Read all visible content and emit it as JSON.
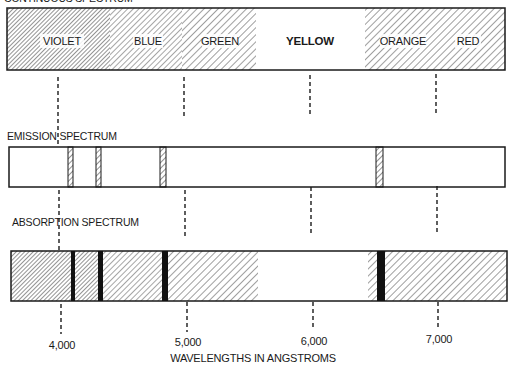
{
  "title": "CONTINUOUS SPECTRUM",
  "continuous_spectrum": {
    "bands": [
      {
        "label": "VIOLET",
        "x_from": 7,
        "x_to": 110,
        "hatch": "dense"
      },
      {
        "label": "BLUE",
        "x_from": 110,
        "x_to": 182,
        "hatch": "medium"
      },
      {
        "label": "GREEN",
        "x_from": 182,
        "x_to": 256,
        "hatch": "sparse"
      },
      {
        "label": "YELLOW",
        "x_from": 256,
        "x_to": 365,
        "hatch": "none"
      },
      {
        "label": "ORANGE",
        "x_from": 365,
        "x_to": 432,
        "hatch": "sparse"
      },
      {
        "label": "RED",
        "x_from": 432,
        "x_to": 505,
        "hatch": "sparse"
      }
    ]
  },
  "emission": {
    "label": "EMISSION SPECTRUM",
    "lines_angstrom": [
      4100,
      4340,
      4860,
      6560
    ]
  },
  "absorption": {
    "label": "ABSORPTION SPECTRUM",
    "lines_angstrom": [
      4100,
      4340,
      4860,
      6560
    ]
  },
  "axis": {
    "label": "WAVELENGTHS IN ANGSTROMS",
    "ticks": [
      {
        "value": 4000,
        "label": "4,000"
      },
      {
        "value": 5000,
        "label": "5,000"
      },
      {
        "value": 6000,
        "label": "6,000"
      },
      {
        "value": 7000,
        "label": "7,000"
      }
    ]
  },
  "colors": {
    "ink": "#1a1a1a",
    "paper": "#ffffff",
    "hatch": "#3a3a3a"
  }
}
